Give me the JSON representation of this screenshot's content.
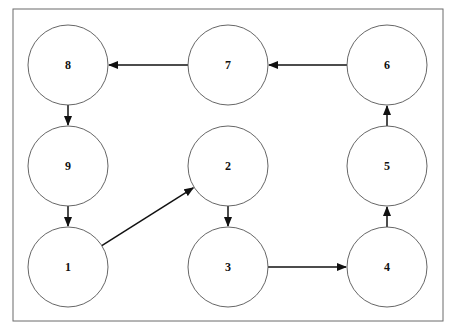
{
  "diagram": {
    "type": "directed-graph",
    "frame": {
      "x": 13,
      "y": 9,
      "width": 430,
      "height": 312
    },
    "node_radius": 40,
    "colors": {
      "stroke": "#555555",
      "edge": "#111111",
      "frame": "#6b6b6b"
    },
    "nodes": [
      {
        "id": "8",
        "label": "8",
        "cx": 68,
        "cy": 65
      },
      {
        "id": "7",
        "label": "7",
        "cx": 228,
        "cy": 65
      },
      {
        "id": "6",
        "label": "6",
        "cx": 387,
        "cy": 65
      },
      {
        "id": "9",
        "label": "9",
        "cx": 68,
        "cy": 166
      },
      {
        "id": "2",
        "label": "2",
        "cx": 228,
        "cy": 166
      },
      {
        "id": "5",
        "label": "5",
        "cx": 387,
        "cy": 166
      },
      {
        "id": "1",
        "label": "1",
        "cx": 68,
        "cy": 267
      },
      {
        "id": "3",
        "label": "3",
        "cx": 228,
        "cy": 267
      },
      {
        "id": "4",
        "label": "4",
        "cx": 387,
        "cy": 267
      }
    ],
    "edges": [
      {
        "from": "1",
        "to": "2"
      },
      {
        "from": "2",
        "to": "3"
      },
      {
        "from": "3",
        "to": "4"
      },
      {
        "from": "4",
        "to": "5"
      },
      {
        "from": "5",
        "to": "6"
      },
      {
        "from": "6",
        "to": "7"
      },
      {
        "from": "7",
        "to": "8"
      },
      {
        "from": "8",
        "to": "9"
      },
      {
        "from": "9",
        "to": "1"
      }
    ]
  }
}
